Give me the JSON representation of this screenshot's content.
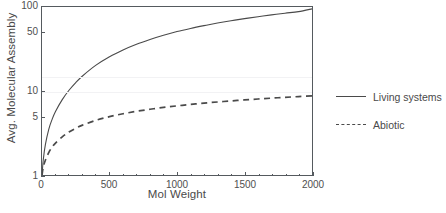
{
  "chart_data": {
    "type": "line",
    "title": "",
    "xlabel": "Mol Weight",
    "ylabel": "Avg. Molecular Assembly",
    "xlim": [
      0,
      2000
    ],
    "ylim": [
      1,
      100
    ],
    "yscale": "log",
    "xscale": "linear",
    "grid": "faint-horizontal",
    "legend_position": "right",
    "xticks": [
      0,
      500,
      1000,
      1500,
      2000
    ],
    "xtick_labels": [
      "0",
      "500",
      "1000",
      "1500",
      "2000"
    ],
    "xminor_tick_step": 100,
    "yticks": [
      1,
      5,
      10,
      50,
      100
    ],
    "ytick_labels": [
      "1",
      "5",
      "10",
      "50",
      "100"
    ],
    "series": [
      {
        "name": "Living systems",
        "style": "solid",
        "color": "#4a4a4a",
        "x": [
          0,
          10,
          25,
          50,
          75,
          100,
          150,
          200,
          250,
          300,
          400,
          500,
          600,
          700,
          800,
          900,
          1000,
          1100,
          1200,
          1300,
          1400,
          1500,
          1600,
          1700,
          1800,
          1900,
          2000
        ],
        "values": [
          1,
          1.55,
          2.3,
          3.5,
          4.6,
          5.7,
          7.9,
          10.2,
          12.6,
          15.1,
          20.3,
          25.6,
          30.8,
          36.0,
          41.0,
          46.0,
          51.0,
          55.6,
          60.0,
          64.4,
          68.6,
          72.7,
          76.7,
          80.6,
          84.4,
          88.1,
          95.0
        ]
      },
      {
        "name": "Abiotic",
        "style": "dashed",
        "color": "#4a4a4a",
        "x": [
          0,
          10,
          25,
          50,
          75,
          100,
          150,
          200,
          250,
          300,
          400,
          500,
          600,
          700,
          800,
          900,
          1000,
          1100,
          1200,
          1300,
          1400,
          1500,
          1600,
          1700,
          1800,
          1900,
          2000
        ],
        "values": [
          1,
          1.25,
          1.5,
          1.85,
          2.15,
          2.4,
          2.85,
          3.25,
          3.6,
          3.92,
          4.48,
          4.95,
          5.36,
          5.73,
          6.06,
          6.37,
          6.65,
          6.92,
          7.17,
          7.4,
          7.62,
          7.83,
          8.03,
          8.22,
          8.4,
          8.58,
          8.75
        ]
      }
    ]
  },
  "legend": {
    "items": [
      {
        "label": "Living systems",
        "style": "solid"
      },
      {
        "label": "Abiotic",
        "style": "dashed"
      }
    ]
  },
  "axes": {
    "y_title": "Avg. Molecular Assembly",
    "x_title": "Mol Weight",
    "y_labels": [
      "100",
      "50",
      "10",
      "5",
      "1"
    ],
    "x_labels": [
      "0",
      "500",
      "1000",
      "1500",
      "2000"
    ]
  }
}
